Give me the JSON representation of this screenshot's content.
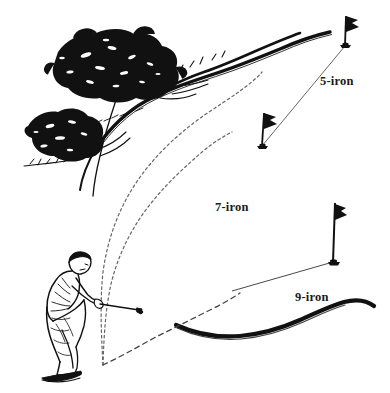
{
  "figure": {
    "type": "illustration",
    "background_color": "#ffffff",
    "ink_color": "#111111"
  },
  "labels": {
    "five_iron": "5-iron",
    "seven_iron": "7-iron",
    "nine_iron": "9-iron"
  },
  "scene": {
    "golfer": {
      "name": "golfer-figure",
      "description": "line-art golfer leaning forward addressing the ball with an iron"
    },
    "trees": [
      {
        "name": "upper-tree",
        "description": "large dark foliage mass"
      },
      {
        "name": "lower-tree",
        "description": "smaller dark foliage mass"
      }
    ],
    "flags": [
      {
        "name": "flag-5-iron",
        "label": "5-iron"
      },
      {
        "name": "flag-7-iron",
        "label": "7-iron"
      },
      {
        "name": "flag-9-iron",
        "label": "9-iron"
      }
    ],
    "trajectories": [
      {
        "name": "trajectory-5-iron",
        "style": "dotted",
        "label": "5-iron"
      },
      {
        "name": "trajectory-7-iron",
        "style": "dotted",
        "label": "7-iron"
      },
      {
        "name": "trajectory-9-iron",
        "style": "dashed",
        "label": "9-iron"
      }
    ],
    "terrain": [
      {
        "name": "fairway-ridge-line",
        "description": "thick dark rough edge across upper area"
      },
      {
        "name": "lower-rough-edge",
        "description": "thick wavy dark edge at lower right"
      }
    ]
  }
}
